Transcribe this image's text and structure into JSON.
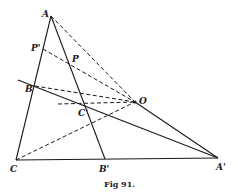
{
  "figure": {
    "caption": "Fig 91.",
    "points": {
      "A": {
        "label": "A",
        "x": 51,
        "y": 16
      },
      "P_prime": {
        "label": "P'",
        "x": 43,
        "y": 49
      },
      "P": {
        "label": "P",
        "x": 70,
        "y": 63
      },
      "B": {
        "label": "B",
        "x": 35,
        "y": 86
      },
      "C_prime": {
        "label": "C'",
        "x": 87,
        "y": 105
      },
      "O": {
        "label": "O",
        "x": 135,
        "y": 102
      },
      "C": {
        "label": "C",
        "x": 16,
        "y": 160
      },
      "B_prime": {
        "label": "B'",
        "x": 105,
        "y": 159
      },
      "A_prime": {
        "label": "A'",
        "x": 218,
        "y": 158
      }
    }
  }
}
